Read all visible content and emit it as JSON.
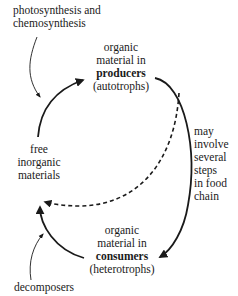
{
  "diagram": {
    "type": "cycle",
    "title": "",
    "nodes": {
      "producers": {
        "line1": "organic",
        "line2": "material in",
        "bold": "producers",
        "paren": "(autotrophs)"
      },
      "consumers": {
        "line1": "organic",
        "line2": "material in",
        "bold": "consumers",
        "paren": "(heterotrophs)"
      },
      "inorganic": {
        "line1": "free",
        "line2": "inorganic",
        "line3": "materials"
      }
    },
    "annotations": {
      "top": {
        "line1": "photosynthesis and",
        "line2": "chemosynthesis"
      },
      "bottom": "decomposers",
      "right": {
        "line1": "may",
        "line2": "involve",
        "line3": "several",
        "line4": "steps",
        "line5": "in food",
        "line6": "chain"
      }
    },
    "edges": [
      {
        "from": "inorganic",
        "to": "producers",
        "style": "solid"
      },
      {
        "from": "producers",
        "to": "consumers",
        "style": "solid",
        "label": "may involve several steps in food chain"
      },
      {
        "from": "consumers",
        "to": "inorganic",
        "style": "solid"
      },
      {
        "from": "producers",
        "to": "inorganic",
        "style": "dashed"
      }
    ],
    "colors": {
      "ink": "#1a1a1a",
      "background": "#ffffff"
    }
  }
}
